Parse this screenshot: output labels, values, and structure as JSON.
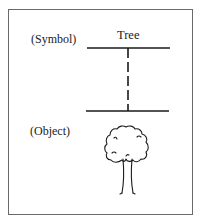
{
  "diagram": {
    "symbol_label": "(Symbol)",
    "object_label": "(Object)",
    "word": "Tree",
    "icons": {
      "object_image": "tree-icon"
    },
    "colors": {
      "line": "#1a1a1a",
      "frame": "#6a6a6a",
      "background": "#ffffff"
    }
  }
}
